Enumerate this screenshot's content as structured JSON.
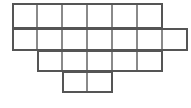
{
  "figure": {
    "canvas": {
      "width": 191,
      "height": 108
    },
    "style": {
      "background_color": "#ffffff",
      "line_color": "#555555",
      "line_color_light": "#8a8a8a",
      "line_width": 1.6,
      "outline_width": 2.0
    },
    "geometry": {
      "cell_size": 25,
      "origin_x": 12,
      "origin_y": 3,
      "column_x": [
        12,
        37,
        62,
        87,
        112,
        137,
        162,
        187
      ],
      "row_y": [
        3,
        28,
        50,
        71,
        92
      ]
    },
    "rows": [
      {
        "index": 1,
        "y_top": 3,
        "y_bottom": 28,
        "col_start": 1,
        "col_end": 6,
        "cell_count": 6
      },
      {
        "index": 2,
        "y_top": 28,
        "y_bottom": 50,
        "col_start": 1,
        "col_end": 7,
        "cell_count": 7
      },
      {
        "index": 3,
        "y_top": 50,
        "y_bottom": 71,
        "col_start": 2,
        "col_end": 6,
        "cell_count": 5
      },
      {
        "index": 4,
        "y_top": 71,
        "y_bottom": 92,
        "col_start": 3,
        "col_end": 4,
        "cell_count": 2
      }
    ],
    "total_cells": 20
  }
}
